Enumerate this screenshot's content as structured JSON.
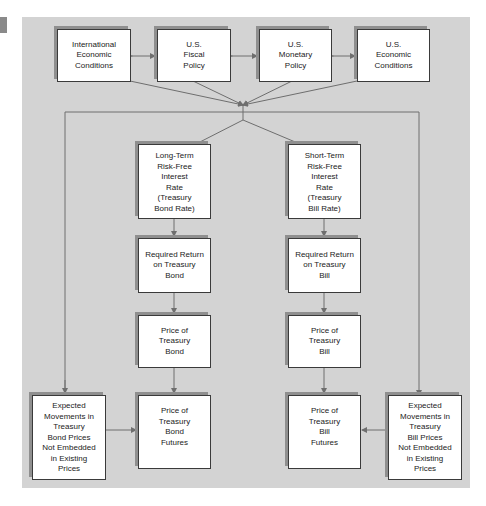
{
  "diagram": {
    "type": "flowchart",
    "title": "",
    "top_row": [
      {
        "id": "intl",
        "label": "International\nEconomic\nConditions"
      },
      {
        "id": "fiscal",
        "label": "U.S.\nFiscal\nPolicy"
      },
      {
        "id": "monetary",
        "label": "U.S.\nMonetary\nPolicy"
      },
      {
        "id": "us_econ",
        "label": "U.S.\nEconomic\nConditions"
      }
    ],
    "bond_chain": [
      {
        "id": "lt_rate",
        "label": "Long-Term\nRisk-Free\nInterest\nRate\n(Treasury\nBond Rate)"
      },
      {
        "id": "req_bond",
        "label": "Required Return\non Treasury\nBond"
      },
      {
        "id": "price_bond",
        "label": "Price of\nTreasury\nBond"
      },
      {
        "id": "bond_futures",
        "label": "Price of\nTreasury\nBond\nFutures"
      }
    ],
    "bill_chain": [
      {
        "id": "st_rate",
        "label": "Short-Term\nRisk-Free\nInterest\nRate\n(Treasury\nBill Rate)"
      },
      {
        "id": "req_bill",
        "label": "Required Return\non Treasury\nBill"
      },
      {
        "id": "price_bill",
        "label": "Price of\nTreasury\nBill"
      },
      {
        "id": "bill_futures",
        "label": "Price of\nTreasury\nBill\nFutures"
      }
    ],
    "expected": [
      {
        "id": "exp_bond",
        "label": "Expected\nMovements in\nTreasury\nBond Prices\nNot Embedded\nin Existing\nPrices"
      },
      {
        "id": "exp_bill",
        "label": "Expected\nMovements in\nTreasury\nBill Prices\nNot Embedded\nin Existing\nPrices"
      }
    ],
    "edges": [
      [
        "intl",
        "fiscal",
        "bidirectional"
      ],
      [
        "fiscal",
        "monetary",
        "bidirectional"
      ],
      [
        "monetary",
        "us_econ",
        "bidirectional"
      ],
      [
        "top_row",
        "lt_rate"
      ],
      [
        "top_row",
        "st_rate"
      ],
      [
        "top_row",
        "exp_bond"
      ],
      [
        "top_row",
        "exp_bill"
      ],
      [
        "lt_rate",
        "req_bond"
      ],
      [
        "req_bond",
        "price_bond"
      ],
      [
        "price_bond",
        "bond_futures"
      ],
      [
        "st_rate",
        "req_bill"
      ],
      [
        "req_bill",
        "price_bill"
      ],
      [
        "price_bill",
        "bill_futures"
      ],
      [
        "exp_bond",
        "bond_futures"
      ],
      [
        "exp_bill",
        "bill_futures"
      ]
    ],
    "colors": {
      "panel": "#d3d3d3",
      "box": "#ffffff",
      "line": "#6e6e6e",
      "shadow": "#8f8f8f"
    }
  }
}
